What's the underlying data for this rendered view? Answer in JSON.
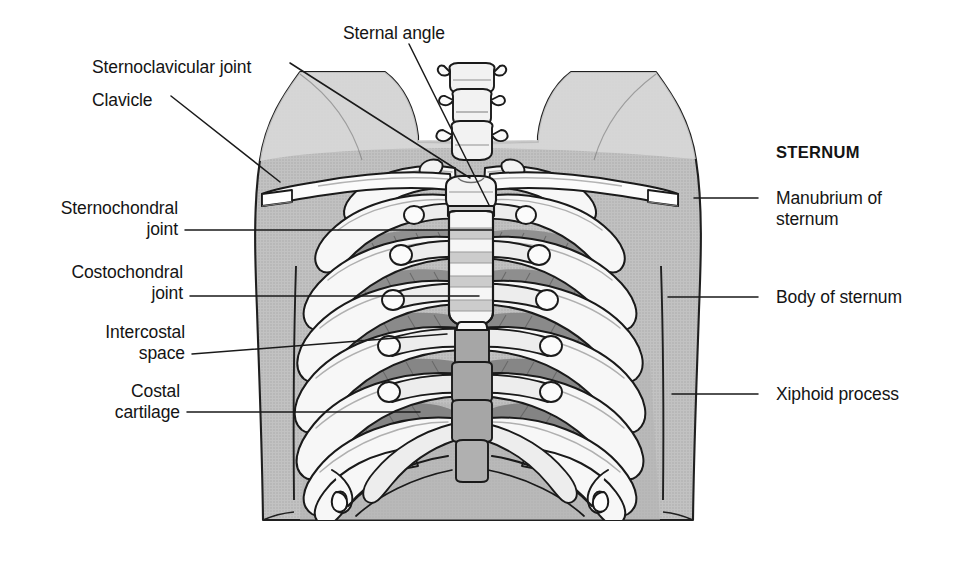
{
  "figure": {
    "width": 956,
    "height": 579,
    "background_color": "#ffffff"
  },
  "colors": {
    "line": "#1a1a1a",
    "bone_light": "#f7f7f7",
    "bone_shadow": "#c9c9c9",
    "cartilage": "#e2e2e2",
    "body_fill": "#b9b9b9",
    "body_fill_light": "#cfcfcf",
    "intercostal_dark": "#8e8e8e",
    "vertebra_fill": "#a2a2a2",
    "text": "#141414"
  },
  "labels": {
    "left": [
      {
        "id": "sternoclavicular-joint",
        "text": "Sternoclavicular joint",
        "x": 92,
        "y": 57,
        "align": "left"
      },
      {
        "id": "clavicle",
        "text": "Clavicle",
        "x": 92,
        "y": 90,
        "align": "left"
      },
      {
        "id": "sternochondral-joint",
        "text": "Sternochondral\njoint",
        "x": 30,
        "y": 198,
        "align": "right"
      },
      {
        "id": "costochondral-joint",
        "text": "Costochondral\njoint",
        "x": 37,
        "y": 262,
        "align": "right"
      },
      {
        "id": "intercostal-space",
        "text": "Intercostal\nspace",
        "x": 72,
        "y": 322,
        "align": "right"
      },
      {
        "id": "costal-cartilage",
        "text": "Costal\ncartilage",
        "x": 72,
        "y": 381,
        "align": "right"
      }
    ],
    "top": [
      {
        "id": "sternal-angle",
        "text": "Sternal angle",
        "x": 343,
        "y": 23,
        "align": "left"
      }
    ],
    "right": [
      {
        "id": "sternum-heading",
        "text": "STERNUM",
        "x": 776,
        "y": 142,
        "align": "left",
        "bold": true
      },
      {
        "id": "manubrium-of-sternum",
        "text": "Manubrium of\nsternum",
        "x": 776,
        "y": 190,
        "align": "left"
      },
      {
        "id": "body-of-sternum",
        "text": "Body of sternum",
        "x": 776,
        "y": 297,
        "align": "left"
      },
      {
        "id": "xiphoid-process",
        "text": "Xiphoid process",
        "x": 776,
        "y": 386,
        "align": "left"
      }
    ]
  },
  "leader_lines": [
    {
      "id": "leader-sternoclavicular-joint",
      "from": [
        290,
        63
      ],
      "to": [
        470,
        178
      ]
    },
    {
      "id": "leader-clavicle",
      "from": [
        171,
        96
      ],
      "to": [
        280,
        182
      ]
    },
    {
      "id": "leader-sternal-angle",
      "from": [
        409,
        44
      ],
      "to": [
        489,
        205
      ]
    },
    {
      "id": "leader-sternochondral-joint",
      "from": [
        185,
        230
      ],
      "to": [
        492,
        230
      ]
    },
    {
      "id": "leader-costochondral-joint",
      "from": [
        190,
        296
      ],
      "to": [
        479,
        296
      ]
    },
    {
      "id": "leader-intercostal-space",
      "from": [
        192,
        354
      ],
      "to": [
        447,
        334
      ]
    },
    {
      "id": "leader-costal-cartilage",
      "from": [
        187,
        412
      ],
      "to": [
        420,
        412
      ]
    },
    {
      "id": "leader-manubrium",
      "from": [
        758,
        198
      ],
      "to": [
        694,
        198
      ]
    },
    {
      "id": "leader-body-of-sternum",
      "from": [
        758,
        297
      ],
      "to": [
        668,
        297
      ]
    },
    {
      "id": "leader-xiphoid-process",
      "from": [
        758,
        394
      ],
      "to": [
        672,
        394
      ]
    }
  ],
  "anatomy": {
    "structures": [
      "cervical vertebrae",
      "clavicle left",
      "clavicle right",
      "manubrium of sternum",
      "body of sternum",
      "xiphoid process",
      "ribs 1-12",
      "costal cartilages",
      "intercostal spaces",
      "thoracic vertebrae",
      "torso silhouette"
    ],
    "rib_pairs": 12,
    "floating_rib_pairs": 2
  }
}
